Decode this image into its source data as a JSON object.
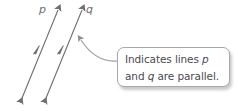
{
  "figure": {
    "type": "geometry-diagram",
    "background_color": "#ffffff",
    "line_color": "#6e6e73",
    "text_color": "#4a4a4f",
    "border_color": "#a8a8ad"
  },
  "lines": [
    {
      "name": "line-p",
      "label": "p",
      "label_position": {
        "x": 39,
        "y": 4
      },
      "start": {
        "x": 20,
        "y": 103
      },
      "end": {
        "x": 58,
        "y": 10
      },
      "arrowheads": "both",
      "parallel_mark_count": 1
    },
    {
      "name": "line-q",
      "label": "q",
      "label_position": {
        "x": 86,
        "y": 4
      },
      "start": {
        "x": 44,
        "y": 103
      },
      "end": {
        "x": 82,
        "y": 10
      },
      "arrowheads": "both",
      "parallel_mark_count": 1
    }
  ],
  "callout": {
    "text_line_1_prefix": "Indicates lines ",
    "text_line_1_variable": "p",
    "text_line_2_prefix": "and ",
    "text_line_2_variable": "q",
    "text_line_2_suffix": " are parallel.",
    "full_text": "Indicates lines p and q are parallel.",
    "box": {
      "x": 117,
      "y": 47,
      "width": 113,
      "height": 40
    }
  },
  "leader": {
    "name": "callout-leader-line",
    "from": {
      "x": 117,
      "y": 61
    },
    "to": {
      "x": 78,
      "y": 37
    },
    "arrowhead": "at-target"
  }
}
